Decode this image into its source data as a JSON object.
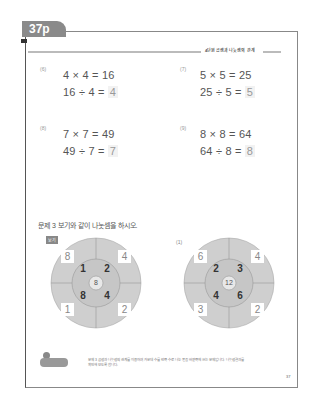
{
  "header": {
    "page_tab": "37p",
    "chapter_title": "4단원 곱셈과 나눗셈의 관계"
  },
  "problems": [
    {
      "num": "(6)",
      "mult": "4 × 4 = 16",
      "div_left": "16 ÷ 4 = ",
      "div_answer": "4"
    },
    {
      "num": "(7)",
      "mult": "5 × 5 = 25",
      "div_left": "25 ÷ 5 = ",
      "div_answer": "5"
    },
    {
      "num": "(8)",
      "mult": "7 × 7 = 49",
      "div_left": "49 ÷ 7 = ",
      "div_answer": "7"
    },
    {
      "num": "(9)",
      "mult": "8 × 8 = 64",
      "div_left": "64 ÷ 8 = ",
      "div_answer": "8"
    }
  ],
  "section3": {
    "question": "문제 3  보기와 같이 나눗셈을 하시오.",
    "example_label": "보기",
    "sub_label": "(1)"
  },
  "wheels": [
    {
      "name": "example",
      "center": "8",
      "inner": [
        "1",
        "2",
        "8",
        "4"
      ],
      "outer": [
        "8",
        "4",
        "1",
        "2"
      ]
    },
    {
      "name": "problem-1",
      "center": "12",
      "inner": [
        "2",
        "3",
        "4",
        "6"
      ],
      "outer": [
        "6",
        "4",
        "3",
        "2"
      ]
    }
  ],
  "footer": {
    "badge": "선생님 도움말",
    "note": "문제 3 곱셈과 나눗셈의 관계를 이용하여 가운데 수를 안쪽 수로 나눈 몫을 바깥쪽에 쓰는 문제입니다. 나눗셈 결과를 확인해 보도록 합니다.",
    "page_number": "37"
  },
  "colors": {
    "wheel_fill": "#cfcfcf",
    "wheel_line": "#999999",
    "tab": "#8a8a8a"
  }
}
